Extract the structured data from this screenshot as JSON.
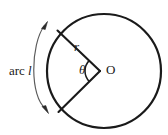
{
  "figure": {
    "background_color": "#ffffff",
    "stroke_color": "#1a1a1a",
    "thin_stroke_color": "#4a4a4a",
    "labels": {
      "arc_prefix": "arc",
      "arc_length": "l",
      "radius": "r",
      "angle": "θ",
      "center": "O"
    },
    "geometry": {
      "circle": {
        "center_x": 104,
        "center_y": 71,
        "radius": 57,
        "stroke_width": 2.2
      },
      "sector_vertex": {
        "x": 100,
        "y": 71
      },
      "radius_upper_end": {
        "x": 57,
        "y": 30
      },
      "radius_lower_end": {
        "x": 58,
        "y": 112
      },
      "angle_arc_radius": 15,
      "arc_indicator": {
        "start": {
          "x": 45,
          "y": 24
        },
        "end": {
          "x": 46,
          "y": 110
        },
        "bulge_x": 26,
        "arrow_size": 5
      }
    }
  }
}
